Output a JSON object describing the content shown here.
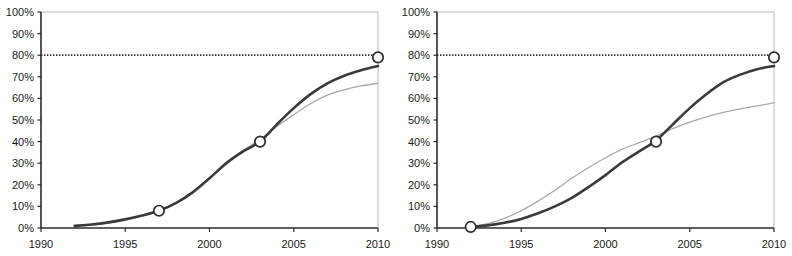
{
  "figure": {
    "panel_count": 2,
    "background_color": "#ffffff"
  },
  "chart_data": [
    {
      "type": "line",
      "title": "",
      "subtitle": "",
      "xlabel": "",
      "ylabel": "",
      "panel": "left",
      "xlim": [
        1990,
        2010
      ],
      "ylim": [
        0,
        100
      ],
      "xticks": [
        1990,
        1995,
        2000,
        2005,
        2010
      ],
      "xticklabels": [
        "1990",
        "1995",
        "2000",
        "2005",
        "2010"
      ],
      "yticks": [
        0,
        10,
        20,
        30,
        40,
        50,
        60,
        70,
        80,
        90,
        100
      ],
      "yticklabels": [
        "0%",
        "10%",
        "20%",
        "30%",
        "40%",
        "50%",
        "60%",
        "70%",
        "80%",
        "90%",
        "100%"
      ],
      "grid": false,
      "legend": "none",
      "series": [
        {
          "name": "dark-curve",
          "color": "#3a3a3a",
          "width": 2.6,
          "style": "solid",
          "x": [
            1992,
            1993,
            1994,
            1995,
            1996,
            1997,
            1998,
            1999,
            2000,
            2001,
            2002,
            2003,
            2004,
            2005,
            2006,
            2007,
            2008,
            2009,
            2010
          ],
          "values": [
            1.0,
            1.6,
            2.6,
            4.0,
            5.8,
            8.0,
            11.5,
            16.5,
            23.0,
            30.0,
            35.5,
            40.0,
            48.0,
            55.5,
            62.0,
            67.0,
            70.5,
            73.0,
            75.0
          ]
        },
        {
          "name": "light-curve",
          "color": "#a8a8a8",
          "width": 1.3,
          "style": "solid",
          "x": [
            1992,
            1993,
            1994,
            1995,
            1996,
            1997,
            1998,
            1999,
            2000,
            2001,
            2002,
            2003,
            2004,
            2005,
            2006,
            2007,
            2008,
            2009,
            2010
          ],
          "values": [
            0.8,
            1.4,
            2.4,
            3.8,
            5.6,
            8.0,
            11.5,
            16.5,
            23.0,
            30.5,
            36.0,
            41.0,
            47.0,
            52.5,
            57.5,
            61.5,
            64.0,
            65.8,
            67.0
          ]
        }
      ],
      "reference_line": {
        "name": "80-percent-target",
        "value": 80,
        "style": "dotted",
        "color": "#2b2b2b"
      },
      "markers": [
        {
          "x": 1997,
          "y": 8,
          "label": "8%"
        },
        {
          "x": 2003,
          "y": 40,
          "label": "40%"
        },
        {
          "x": 2010,
          "y": 79,
          "label": "79%"
        }
      ]
    },
    {
      "type": "line",
      "title": "",
      "subtitle": "",
      "xlabel": "",
      "ylabel": "",
      "panel": "right",
      "xlim": [
        1990,
        2010
      ],
      "ylim": [
        0,
        100
      ],
      "xticks": [
        1990,
        1995,
        2000,
        2005,
        2010
      ],
      "xticklabels": [
        "1990",
        "1995",
        "2000",
        "2005",
        "2010"
      ],
      "yticks": [
        0,
        10,
        20,
        30,
        40,
        50,
        60,
        70,
        80,
        90,
        100
      ],
      "yticklabels": [
        "0%",
        "10%",
        "20%",
        "30%",
        "40%",
        "50%",
        "60%",
        "70%",
        "80%",
        "90%",
        "100%"
      ],
      "grid": false,
      "legend": "none",
      "series": [
        {
          "name": "dark-curve",
          "color": "#3a3a3a",
          "width": 2.6,
          "style": "solid",
          "x": [
            1992,
            1993,
            1994,
            1995,
            1996,
            1997,
            1998,
            1999,
            2000,
            2001,
            2002,
            2003,
            2004,
            2005,
            2006,
            2007,
            2008,
            2009,
            2010
          ],
          "values": [
            0.5,
            1.2,
            2.4,
            4.2,
            6.8,
            10.0,
            14.0,
            19.0,
            24.5,
            30.5,
            35.5,
            40.5,
            48.0,
            55.5,
            62.0,
            67.5,
            71.0,
            73.5,
            75.0
          ]
        },
        {
          "name": "light-curve",
          "color": "#a8a8a8",
          "width": 1.3,
          "style": "solid",
          "x": [
            1992,
            1993,
            1994,
            1995,
            1996,
            1997,
            1998,
            1999,
            2000,
            2001,
            2002,
            2003,
            2004,
            2005,
            2006,
            2007,
            2008,
            2009,
            2010
          ],
          "values": [
            0.6,
            2.0,
            4.5,
            8.0,
            12.5,
            17.5,
            23.0,
            28.0,
            32.5,
            36.5,
            39.5,
            42.5,
            46.0,
            49.0,
            51.5,
            53.5,
            55.2,
            56.5,
            58.0
          ]
        }
      ],
      "reference_line": {
        "name": "80-percent-target",
        "value": 80,
        "style": "dotted",
        "color": "#2b2b2b"
      },
      "markers": [
        {
          "x": 1992,
          "y": 0.5,
          "label": "0%"
        },
        {
          "x": 2003,
          "y": 40,
          "label": "40%"
        },
        {
          "x": 2010,
          "y": 79,
          "label": "79%"
        }
      ]
    }
  ],
  "style": {
    "axis_color": "#2b2b2b",
    "frame_color": "#b9b9b9",
    "tick_label_color": "#1a1a1a",
    "marker_fill": "#ffffff",
    "marker_stroke": "#2b2b2b"
  }
}
